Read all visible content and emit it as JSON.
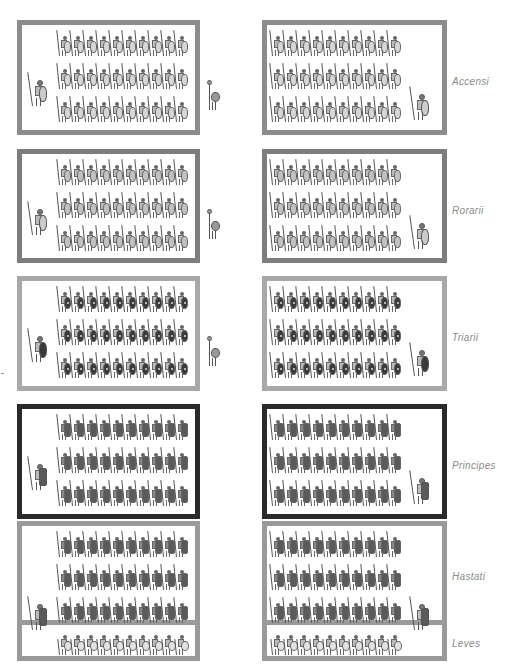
{
  "colors": {
    "accensi_border": "#8c8c8c",
    "rorarii_border": "#7d7d7d",
    "triarii_border": "#a8a8a8",
    "principes_border": "#2a2a2a",
    "hastati_border": "#9a9a9a",
    "label_text": "#8a8a8a"
  },
  "rows": [
    {
      "id": "accensi",
      "label": "Accensi",
      "ranks": 3,
      "files": 10,
      "soldier_style": "t-light",
      "top": 20,
      "height": 115,
      "border_color": "#8c8c8c"
    },
    {
      "id": "rorarii",
      "label": "Rorarii",
      "ranks": 3,
      "files": 10,
      "soldier_style": "t-mid",
      "top": 149,
      "height": 114,
      "border_color": "#7d7d7d"
    },
    {
      "id": "triarii",
      "label": "Triarii",
      "ranks": 3,
      "files": 10,
      "soldier_style": "t-dark",
      "top": 276,
      "height": 115,
      "border_color": "#a8a8a8"
    },
    {
      "id": "principes",
      "label": "Principes",
      "ranks": 3,
      "files": 10,
      "soldier_style": "t-scutum",
      "top": 404,
      "height": 115,
      "border_color": "#2a2a2a"
    },
    {
      "id": "hastati",
      "label": "Hastati",
      "ranks": 3,
      "files": 10,
      "soldier_style": "t-scutum",
      "top": 521,
      "height": 140,
      "border_color": "#9a9a9a"
    },
    {
      "id": "leves",
      "label": "Leves",
      "ranks": 1,
      "files": 10,
      "soldier_style": "t-leves"
    }
  ],
  "columns": [
    {
      "id": "left-maniple",
      "x": 17,
      "width": 183
    },
    {
      "id": "right-maniple",
      "x": 262,
      "width": 185
    }
  ]
}
